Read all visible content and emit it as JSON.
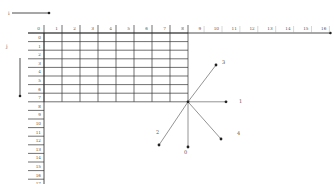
{
  "diagram": {
    "axis_x_label": "i",
    "axis_y_label": "j",
    "column_labels": [
      "0",
      "1",
      "2",
      "3",
      "4",
      "5",
      "6",
      "7",
      "8",
      "9",
      "10",
      "11",
      "12",
      "13",
      "14",
      "15",
      "16"
    ],
    "row_labels": [
      "0",
      "1",
      "2",
      "3",
      "4",
      "5",
      "6",
      "7",
      "8",
      "9",
      "10",
      "11",
      "12",
      "13",
      "14",
      "15",
      "16",
      "17",
      "18"
    ],
    "grid_columns": 8,
    "grid_rows": 8,
    "vectors": [
      {
        "label": "3",
        "direction": "up-right"
      },
      {
        "label": "1",
        "direction": "right"
      },
      {
        "label": "4",
        "direction": "down-right"
      },
      {
        "label": "0",
        "direction": "down"
      },
      {
        "label": "2",
        "direction": "down-left"
      }
    ],
    "colors": {
      "grid": "#333333",
      "axis": "#222222",
      "vector": "#888888",
      "label": "#555555"
    }
  }
}
